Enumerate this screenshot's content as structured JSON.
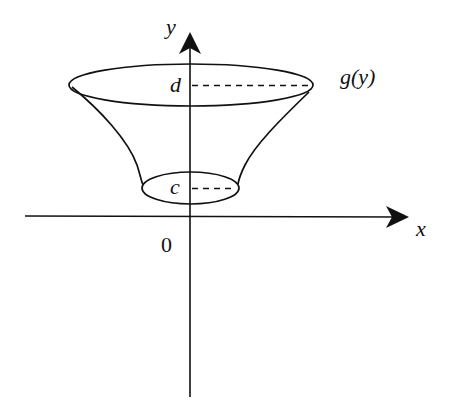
{
  "diagram": {
    "type": "solid-of-revolution",
    "colors": {
      "stroke": "#111111",
      "background": "#ffffff"
    },
    "axes": {
      "x_label": "x",
      "y_label": "y",
      "origin_label": "0"
    },
    "levels": {
      "top_label": "d",
      "bottom_label": "c"
    },
    "curve_label": "g(y)"
  }
}
